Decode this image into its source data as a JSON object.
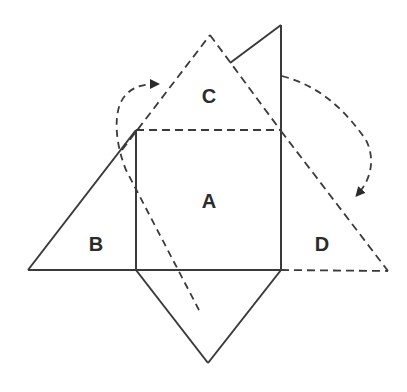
{
  "diagram": {
    "labels": {
      "A": "A",
      "B": "B",
      "C": "C",
      "D": "D"
    },
    "colors": {
      "stroke": "#3a3a3a",
      "background": "#ffffff"
    }
  }
}
